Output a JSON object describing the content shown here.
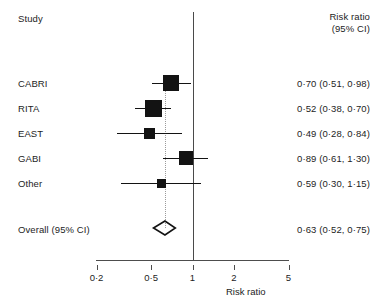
{
  "figure": {
    "type": "forest-plot",
    "header_study": "Study",
    "header_effect_line1": "Risk ratio",
    "header_effect_line2": "(95% CI)",
    "axis_title": "Risk ratio"
  },
  "axis": {
    "scale": "log",
    "min": 0.2,
    "max": 5,
    "ticks": [
      {
        "value": 0.2,
        "label": "0·2"
      },
      {
        "value": 0.5,
        "label": "0·5"
      },
      {
        "value": 1,
        "label": "1"
      },
      {
        "value": 2,
        "label": "2"
      },
      {
        "value": 5,
        "label": "5"
      }
    ],
    "reference_line": 1,
    "dotted_line": 0.63
  },
  "rows": [
    {
      "study": "CABRI",
      "estimate": 0.7,
      "lower": 0.51,
      "upper": 0.98,
      "text": "0·70 (0·51, 0·98)",
      "marker_size": 16
    },
    {
      "study": "RITA",
      "estimate": 0.52,
      "lower": 0.38,
      "upper": 0.7,
      "text": "0·52 (0·38, 0·70)",
      "marker_size": 17
    },
    {
      "study": "EAST",
      "estimate": 0.49,
      "lower": 0.28,
      "upper": 0.84,
      "text": "0·49 (0·28, 0·84)",
      "marker_size": 11
    },
    {
      "study": "GABI",
      "estimate": 0.89,
      "lower": 0.61,
      "upper": 1.3,
      "text": "0·89 (0·61, 1·30)",
      "marker_size": 14
    },
    {
      "study": "Other",
      "estimate": 0.59,
      "lower": 0.3,
      "upper": 1.15,
      "text": "0·59 (0·30, 1·15)",
      "marker_size": 9
    }
  ],
  "overall": {
    "label": "Overall (95% CI)",
    "estimate": 0.63,
    "lower": 0.52,
    "upper": 0.75,
    "text": "0·63 (0·52, 0·75)"
  },
  "chart_data": {
    "type": "forest",
    "title": "",
    "xlabel": "Risk ratio",
    "ylabel": "",
    "xscale": "log",
    "xlim": [
      0.2,
      5
    ],
    "xticks": [
      0.2,
      0.5,
      1,
      2,
      5
    ],
    "xticklabels": [
      "0·2",
      "0·5",
      "1",
      "2",
      "5"
    ],
    "grid": false,
    "legend": "none",
    "reference_line": 1,
    "categories": [
      "CABRI",
      "RITA",
      "EAST",
      "GABI",
      "Other",
      "Overall (95% CI)"
    ],
    "values": [
      0.7,
      0.52,
      0.49,
      0.89,
      0.59,
      0.63
    ],
    "ci_lower": [
      0.51,
      0.38,
      0.28,
      0.61,
      0.3,
      0.52
    ],
    "ci_upper": [
      0.98,
      0.7,
      0.84,
      1.3,
      1.15,
      0.75
    ],
    "labels": [
      "0·70 (0·51, 0·98)",
      "0·52 (0·38, 0·70)",
      "0·49 (0·28, 0·84)",
      "0·89 (0·61, 1·30)",
      "0·59 (0·30, 1·15)",
      "0·63 (0·52, 0·75)"
    ]
  }
}
